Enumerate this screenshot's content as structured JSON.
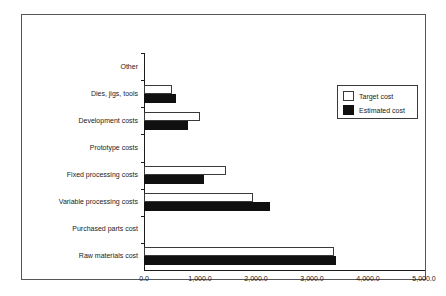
{
  "chart_data": {
    "type": "bar",
    "orientation": "horizontal",
    "title": "",
    "xlabel": "",
    "ylabel": "",
    "xlim": [
      0,
      5000
    ],
    "grid": false,
    "legend_position": "upper right",
    "xticks": [
      "0.0",
      "1,000.0",
      "2,000.0",
      "3,000.0",
      "4,000.0",
      "5,000.0"
    ],
    "xtick_values": [
      0,
      1000,
      2000,
      3000,
      4000,
      5000
    ],
    "categories": [
      "Raw materials cost",
      "Purchased parts cost",
      "Variable processing costs",
      "Fixed processing costs",
      "Prototype costs",
      "Development costs",
      "Dies, jigs, tools",
      "Other"
    ],
    "series": [
      {
        "name": "Target cost",
        "color": "#ffffff",
        "values": [
          3400,
          0,
          1950,
          1470,
          0,
          1000,
          500,
          0
        ]
      },
      {
        "name": "Estimated cost",
        "color": "#101010",
        "values": [
          3430,
          0,
          2250,
          1080,
          0,
          790,
          570,
          0
        ]
      }
    ]
  },
  "legend": {
    "items": [
      {
        "label": "Target cost"
      },
      {
        "label": "Estimated cost"
      }
    ]
  }
}
